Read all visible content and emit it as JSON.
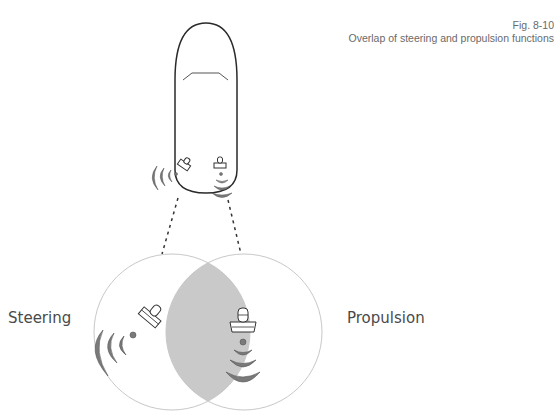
{
  "figure": {
    "number": "Fig. 8-10",
    "caption": "Overlap of steering and propulsion functions"
  },
  "labels": {
    "steering": "Steering",
    "propulsion": "Propulsion"
  },
  "colors": {
    "hull_stroke": "#2a2a2a",
    "circle_stroke": "#c8c8c8",
    "overlap_fill": "#c9c9c9",
    "wave_fill": "#7a7a7a",
    "wave_stroke": "#555555",
    "text": "#4a4a4a"
  },
  "icons": {
    "boat": "boat-hull-icon",
    "steering_thruster": "azimuth-thruster-icon",
    "propulsion_thruster": "thruster-icon",
    "wash": "thrust-wave-icon"
  }
}
